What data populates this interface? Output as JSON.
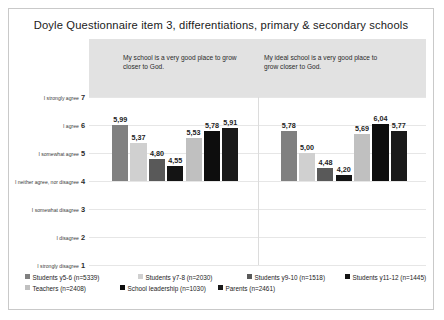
{
  "title": "Doyle Questionnaire item 3, differentiations, primary & secondary schools",
  "chart_data": {
    "type": "bar",
    "title": "Doyle Questionnaire item 3, differentiations, primary & secondary schools",
    "xlabel": "",
    "ylabel": "",
    "ylim": [
      1,
      7
    ],
    "baseline": 4,
    "grid": true,
    "legend_position": "bottom",
    "value_decimal_separator": ",",
    "groups": [
      "My school is a very good place to grow closer to God.",
      "My ideal school is a very good place to grow closer to God."
    ],
    "categories": [
      "Students y5-6 (n=5339)",
      "Students y7-8 (n=2030)",
      "Students y9-10 (n=1518)",
      "Students y11-12 (n=1445)",
      "Teachers (n=2408)",
      "School leadership (n=1030)",
      "Parents (n=2461)"
    ],
    "series": [
      {
        "name": "My school is a very good place to grow closer to God.",
        "values": [
          5.99,
          5.37,
          4.8,
          4.55,
          5.53,
          5.78,
          5.91
        ],
        "labels": [
          "5,99",
          "5,37",
          "4,80",
          "4,55",
          "5,53",
          "5,78",
          "5,91"
        ]
      },
      {
        "name": "My ideal school is a very good place to grow closer to God.",
        "values": [
          5.78,
          5.0,
          4.48,
          4.2,
          5.69,
          6.04,
          5.77
        ],
        "labels": [
          "5,78",
          "5,00",
          "4,48",
          "4,20",
          "5,69",
          "6,04",
          "5,77"
        ]
      }
    ],
    "colors": [
      "#808080",
      "#d0d0d0",
      "#595959",
      "#141414",
      "#c0c0c0",
      "#0d0d0d",
      "#1a1a1a"
    ],
    "y_ticks": [
      {
        "value": 7,
        "number": "7",
        "label": "I strongly agree"
      },
      {
        "value": 6,
        "number": "6",
        "label": "I agree"
      },
      {
        "value": 5,
        "number": "5",
        "label": "I somewhat agree"
      },
      {
        "value": 4,
        "number": "4",
        "label": "I neither agree, nor disagree"
      },
      {
        "value": 3,
        "number": "3",
        "label": "I somewhat disagree"
      },
      {
        "value": 2,
        "number": "2",
        "label": "I disagree"
      },
      {
        "value": 1,
        "number": "1",
        "label": "I strongly disagree"
      }
    ]
  },
  "legend": {
    "items": [
      {
        "label": "Students y5-6 (n=5339)",
        "color": "#808080"
      },
      {
        "label": "Students y7-8 (n=2030)",
        "color": "#d0d0d0"
      },
      {
        "label": "Students y9-10 (n=1518)",
        "color": "#595959"
      },
      {
        "label": "Students y11-12 (n=1445)",
        "color": "#141414"
      },
      {
        "label": "Teachers (n=2408)",
        "color": "#c0c0c0"
      },
      {
        "label": "School leadership (n=1030)",
        "color": "#0d0d0d"
      },
      {
        "label": "Parents (n=2461)",
        "color": "#1a1a1a"
      }
    ]
  }
}
